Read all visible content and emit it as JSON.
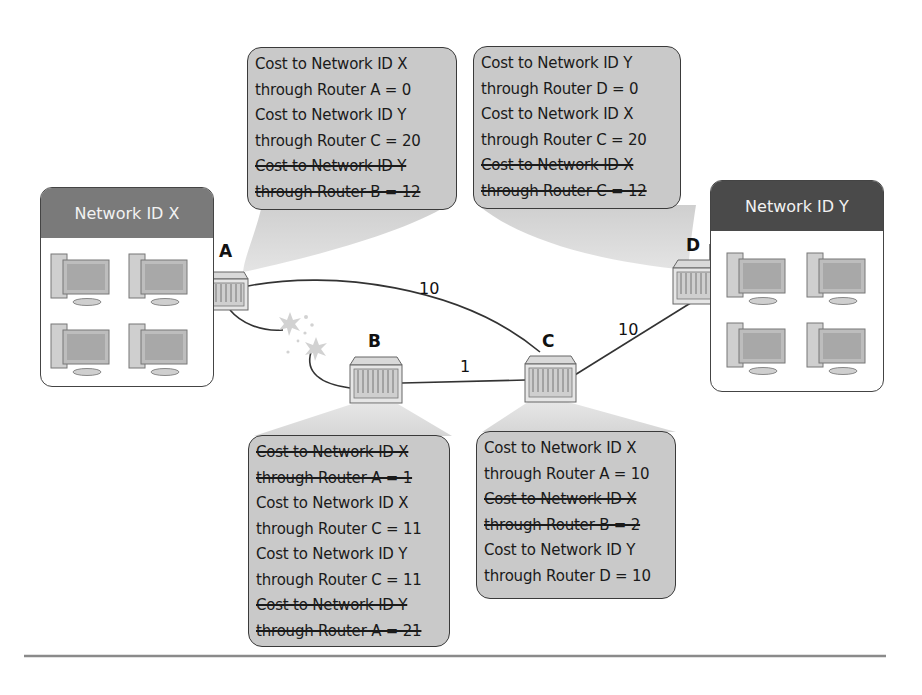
{
  "diagram": {
    "type": "network routing diagram (distance-vector cost tables)",
    "colors": {
      "callout_fill": "#c9c9c9",
      "network_x_header": "#7a7a7a",
      "network_y_header": "#4a4a4a",
      "line": "#333333",
      "spark": "#c8c8c8"
    },
    "networks": [
      {
        "id": "network-x",
        "title": "Network ID X",
        "computers": 4
      },
      {
        "id": "network-y",
        "title": "Network ID Y",
        "computers": 4
      }
    ],
    "routers": [
      {
        "id": "router-a",
        "label": "A"
      },
      {
        "id": "router-b",
        "label": "B"
      },
      {
        "id": "router-c",
        "label": "C"
      },
      {
        "id": "router-d",
        "label": "D"
      }
    ],
    "links": [
      {
        "from": "A",
        "to": "C",
        "cost": "10"
      },
      {
        "from": "B",
        "to": "C",
        "cost": "1"
      },
      {
        "from": "C",
        "to": "D",
        "cost": "10"
      },
      {
        "from": "A",
        "to": "B",
        "cost": "",
        "status": "broken"
      }
    ],
    "callouts": {
      "router_a": [
        {
          "text": "Cost to Network ID X",
          "struck": false
        },
        {
          "text": "through Router A = 0",
          "struck": false
        },
        {
          "text": "Cost to Network ID Y",
          "struck": false
        },
        {
          "text": "through Router C = 20",
          "struck": false
        },
        {
          "text": "Cost to Network ID Y",
          "struck": true
        },
        {
          "text": "through Router B = 12",
          "struck": true
        }
      ],
      "router_d": [
        {
          "text": "Cost to Network ID Y",
          "struck": false
        },
        {
          "text": "through Router D = 0",
          "struck": false
        },
        {
          "text": "Cost to Network ID X",
          "struck": false
        },
        {
          "text": "through Router C = 20",
          "struck": false
        },
        {
          "text": "Cost to Network ID X",
          "struck": true
        },
        {
          "text": "through Router C = 12",
          "struck": true
        }
      ],
      "router_b": [
        {
          "text": "Cost to Network ID X",
          "struck": true
        },
        {
          "text": "through Router A = 1",
          "struck": true
        },
        {
          "text": "Cost to Network ID X",
          "struck": false
        },
        {
          "text": "through Router C = 11",
          "struck": false
        },
        {
          "text": "Cost to Network ID Y",
          "struck": false
        },
        {
          "text": "through Router C = 11",
          "struck": false
        },
        {
          "text": "Cost to Network ID Y",
          "struck": true
        },
        {
          "text": "through Router A = 21",
          "struck": true
        }
      ],
      "router_c": [
        {
          "text": "Cost to Network ID X",
          "struck": false
        },
        {
          "text": "through Router A = 10",
          "struck": false
        },
        {
          "text": "Cost to Network ID X",
          "struck": true
        },
        {
          "text": "through Router B = 2",
          "struck": true
        },
        {
          "text": "Cost to Network ID Y",
          "struck": false
        },
        {
          "text": "through Router D = 10",
          "struck": false
        }
      ]
    }
  }
}
